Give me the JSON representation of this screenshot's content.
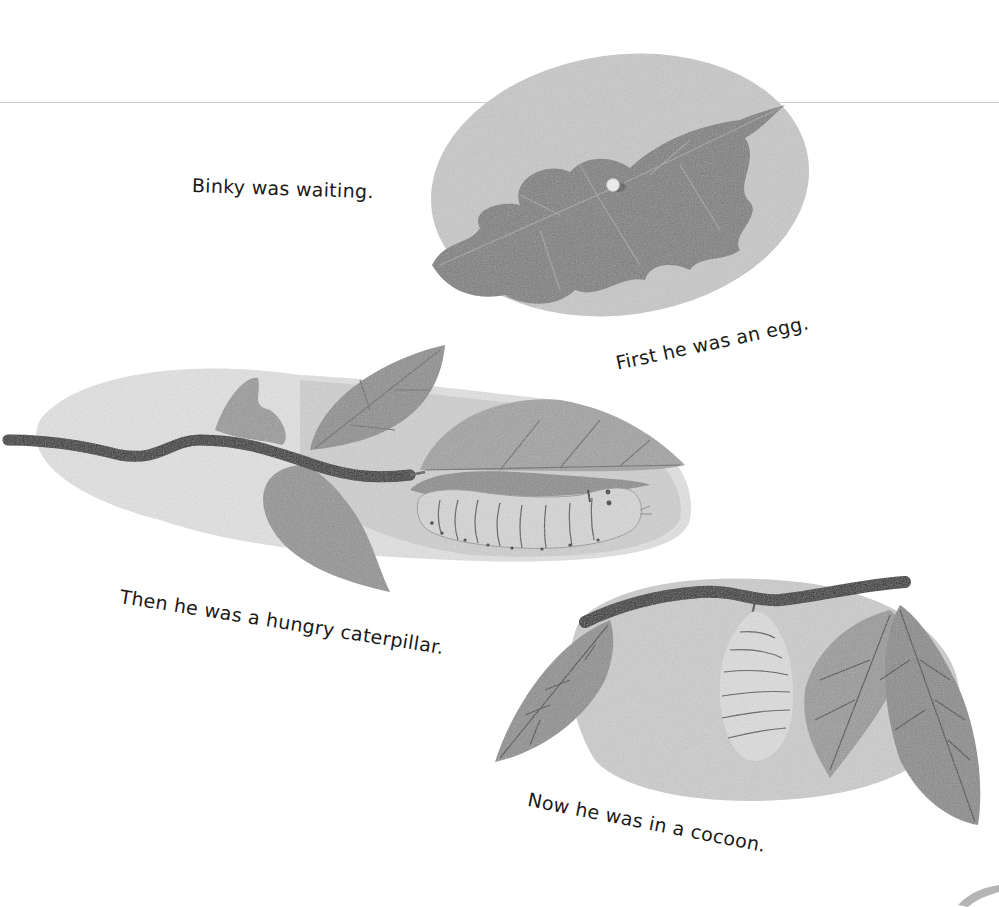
{
  "page": {
    "background_color": "#ffffff",
    "rule_color": "#cfcfcf"
  },
  "captions": {
    "waiting": "Binky was waiting.",
    "egg": "First he was an egg.",
    "caterpillar": "Then he was a hungry caterpillar.",
    "cocoon": "Now he was in a cocoon."
  },
  "illustrations": [
    {
      "name": "oak-leaf-with-egg",
      "description": "Oak leaf on a gray oval with a small white egg"
    },
    {
      "name": "branch-with-caterpillar",
      "description": "Dark branch with leaves and a pale caterpillar"
    },
    {
      "name": "branch-with-cocoon",
      "description": "Dark branch with leaves and a hanging cocoon"
    }
  ],
  "colors": {
    "ink": "#1a1a1a",
    "branch": "#2a2a2a",
    "leaf_dark": "#7d7d7d",
    "leaf_mid": "#9a9a9a",
    "backdrop_light": "#e2e2e2",
    "backdrop_mid": "#c8c8c8",
    "caterpillar_body": "#d6d6d6",
    "cocoon_body": "#dadada"
  }
}
